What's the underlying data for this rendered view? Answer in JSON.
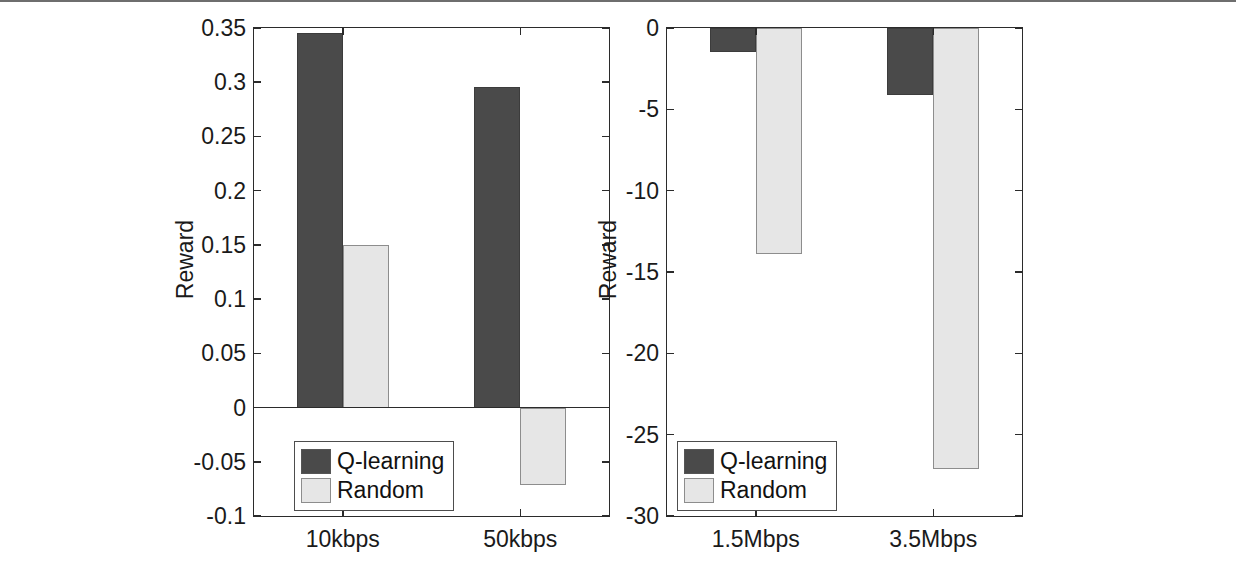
{
  "figure": {
    "background": "#ffffff",
    "series_colors": {
      "q_learning": "#4a4a4a",
      "random": "#e6e6e6"
    }
  },
  "chart_data": [
    {
      "id": "left",
      "type": "bar",
      "title": "",
      "xlabel": "",
      "ylabel": "Reward",
      "categories": [
        "10kbps",
        "50kbps"
      ],
      "series": [
        {
          "name": "Q-learning",
          "values": [
            0.345,
            0.296
          ]
        },
        {
          "name": "Random",
          "values": [
            0.15,
            -0.071
          ]
        }
      ],
      "ylim": [
        -0.1,
        0.35
      ],
      "yticks": [
        0.35,
        0.3,
        0.25,
        0.2,
        0.15,
        0.1,
        0.05,
        0,
        -0.05,
        -0.1
      ],
      "ytick_labels": [
        "0.35",
        "0.3",
        "0.25",
        "0.2",
        "0.15",
        "0.1",
        "0.05",
        "0",
        "-0.05",
        "-0.1"
      ],
      "grid": false,
      "legend": {
        "position": "lower-left",
        "entries": [
          "Q-learning",
          "Random"
        ]
      }
    },
    {
      "id": "right",
      "type": "bar",
      "title": "",
      "xlabel": "",
      "ylabel": "Reward",
      "categories": [
        "1.5Mbps",
        "3.5Mbps"
      ],
      "series": [
        {
          "name": "Q-learning",
          "values": [
            -1.5,
            -4.1
          ]
        },
        {
          "name": "Random",
          "values": [
            -13.9,
            -27.1
          ]
        }
      ],
      "ylim": [
        -30,
        0
      ],
      "yticks": [
        0,
        -5,
        -10,
        -15,
        -20,
        -25,
        -30
      ],
      "ytick_labels": [
        "0",
        "-5",
        "-10",
        "-15",
        "-20",
        "-25",
        "-30"
      ],
      "grid": false,
      "legend": {
        "position": "lower-left",
        "entries": [
          "Q-learning",
          "Random"
        ]
      }
    }
  ]
}
